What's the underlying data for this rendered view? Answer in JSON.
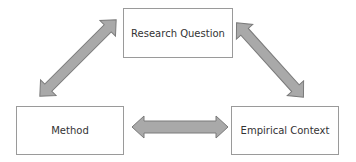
{
  "diagram": {
    "nodes": [
      {
        "id": "research-question",
        "label": "Research Question"
      },
      {
        "id": "method",
        "label": "Method"
      },
      {
        "id": "empirical-context",
        "label": "Empirical Context"
      }
    ],
    "edges": [
      {
        "from": "method",
        "to": "research-question",
        "type": "bidirectional"
      },
      {
        "from": "research-question",
        "to": "empirical-context",
        "type": "bidirectional"
      },
      {
        "from": "method",
        "to": "empirical-context",
        "type": "bidirectional"
      }
    ],
    "colors": {
      "arrow_fill": "#a9a9a9",
      "arrow_stroke": "#7a7a7a",
      "box_border": "#9a9a9a"
    }
  }
}
